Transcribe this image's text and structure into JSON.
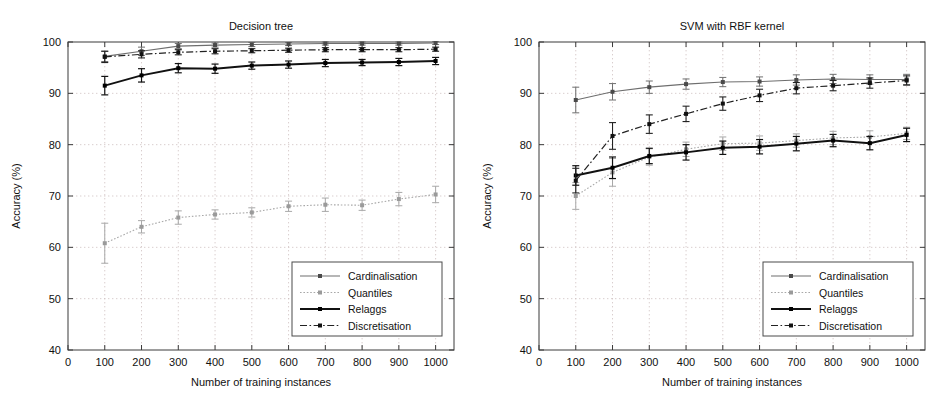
{
  "figure": {
    "background": "#ffffff",
    "panel_count": 2
  },
  "chart_data": [
    {
      "type": "line",
      "title": "Decision tree",
      "xlabel": "Number of training instances",
      "ylabel": "Accuracy  (%)",
      "xlim": [
        0,
        1050
      ],
      "ylim": [
        40,
        100
      ],
      "xticks": [
        0,
        100,
        200,
        300,
        400,
        500,
        600,
        700,
        800,
        900,
        1000
      ],
      "xticklabels": [
        "0",
        "100",
        "200",
        "300",
        "400",
        "500",
        "600",
        "700",
        "800",
        "900",
        "1000"
      ],
      "yticks": [
        40,
        50,
        60,
        70,
        80,
        90,
        100
      ],
      "yticklabels": [
        "40",
        "50",
        "60",
        "70",
        "80",
        "90",
        "100"
      ],
      "grid": true,
      "legend_position": "lower right",
      "x": [
        100,
        200,
        300,
        400,
        500,
        600,
        700,
        800,
        900,
        1000
      ],
      "series": [
        {
          "name": "Cardinalisation",
          "style": "solid-thin-gray",
          "color": "#6e6e6e",
          "values": [
            97.2,
            98.2,
            99.2,
            99.4,
            99.5,
            99.6,
            99.7,
            99.7,
            99.7,
            99.8
          ],
          "errors": [
            1.0,
            0.8,
            0.5,
            0.4,
            0.4,
            0.3,
            0.3,
            0.3,
            0.3,
            0.3
          ]
        },
        {
          "name": "Quantiles",
          "style": "dotted-light-gray",
          "color": "#a8a8a8",
          "values": [
            60.8,
            64.0,
            65.8,
            66.4,
            66.8,
            68.0,
            68.3,
            68.2,
            69.4,
            70.3
          ],
          "errors": [
            3.9,
            1.2,
            1.3,
            0.9,
            0.9,
            1.0,
            1.3,
            1.0,
            1.3,
            1.6
          ]
        },
        {
          "name": "Relaggs",
          "style": "solid-thick-black",
          "color": "#000000",
          "values": [
            91.5,
            93.5,
            94.9,
            94.8,
            95.4,
            95.6,
            95.9,
            96.0,
            96.1,
            96.3
          ],
          "errors": [
            1.8,
            1.3,
            0.9,
            0.9,
            0.7,
            0.7,
            0.7,
            0.6,
            0.7,
            0.7
          ]
        },
        {
          "name": "Discretisation",
          "style": "dash-dot-black",
          "color": "#222222",
          "values": [
            97.1,
            97.6,
            98.0,
            98.2,
            98.3,
            98.4,
            98.5,
            98.5,
            98.5,
            98.6
          ],
          "errors": [
            1.1,
            0.7,
            0.5,
            0.5,
            0.4,
            0.4,
            0.4,
            0.4,
            0.4,
            0.4
          ]
        }
      ]
    },
    {
      "type": "line",
      "title": "SVM  with RBF kernel",
      "xlabel": "Number of training instances",
      "ylabel": "Accuracy  (%)",
      "xlim": [
        0,
        1050
      ],
      "ylim": [
        40,
        100
      ],
      "xticks": [
        0,
        100,
        200,
        300,
        400,
        500,
        600,
        700,
        800,
        900,
        1000
      ],
      "xticklabels": [
        "0",
        "100",
        "200",
        "300",
        "400",
        "500",
        "600",
        "700",
        "800",
        "900",
        "1000"
      ],
      "yticks": [
        40,
        50,
        60,
        70,
        80,
        90,
        100
      ],
      "yticklabels": [
        "40",
        "50",
        "60",
        "70",
        "80",
        "90",
        "100"
      ],
      "grid": true,
      "legend_position": "lower right",
      "x": [
        100,
        200,
        300,
        400,
        500,
        600,
        700,
        800,
        900,
        1000
      ],
      "series": [
        {
          "name": "Cardinalisation",
          "style": "solid-thin-gray",
          "color": "#6e6e6e",
          "values": [
            88.7,
            90.3,
            91.2,
            91.8,
            92.2,
            92.3,
            92.6,
            92.8,
            92.7,
            92.7
          ],
          "errors": [
            2.5,
            1.6,
            1.2,
            1.0,
            0.9,
            0.9,
            1.0,
            0.9,
            0.9,
            1.0
          ]
        },
        {
          "name": "Quantiles",
          "style": "dotted-light-gray",
          "color": "#a8a8a8",
          "values": [
            70.0,
            74.6,
            77.6,
            79.1,
            80.2,
            80.3,
            80.8,
            81.3,
            81.5,
            82.2
          ],
          "errors": [
            2.6,
            2.7,
            1.6,
            1.4,
            1.3,
            1.4,
            1.3,
            1.3,
            1.2,
            1.2
          ]
        },
        {
          "name": "Relaggs",
          "style": "solid-thick-black",
          "color": "#000000",
          "values": [
            74.0,
            75.5,
            77.8,
            78.5,
            79.4,
            79.6,
            80.2,
            80.8,
            80.3,
            81.9
          ],
          "errors": [
            1.9,
            2.1,
            1.5,
            1.5,
            1.3,
            1.4,
            1.4,
            1.2,
            1.3,
            1.3
          ]
        },
        {
          "name": "Discretisation",
          "style": "dash-dot-black",
          "color": "#222222",
          "values": [
            73.0,
            81.7,
            84.0,
            86.0,
            88.0,
            89.6,
            91.0,
            91.5,
            92.0,
            92.5
          ],
          "errors": [
            2.4,
            2.6,
            1.8,
            1.5,
            1.3,
            1.2,
            1.1,
            1.0,
            1.0,
            0.9
          ]
        }
      ]
    }
  ],
  "legend": {
    "items": [
      {
        "label": "Cardinalisation"
      },
      {
        "label": "Quantiles"
      },
      {
        "label": "Relaggs"
      },
      {
        "label": "Discretisation"
      }
    ]
  }
}
